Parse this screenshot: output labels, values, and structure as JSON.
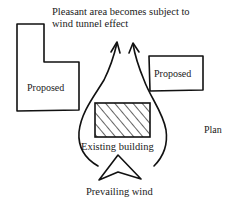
{
  "diagram": {
    "title_line1": "Pleasant area becomes subject to",
    "title_line2": "wind tunnel effect",
    "left_building_label": "Proposed",
    "right_building_label": "Proposed",
    "existing_building_label": "Existing building",
    "wind_label": "Prevailing wind",
    "view_label": "Plan",
    "colors": {
      "ink": "#111111",
      "background": "#ffffff"
    }
  }
}
